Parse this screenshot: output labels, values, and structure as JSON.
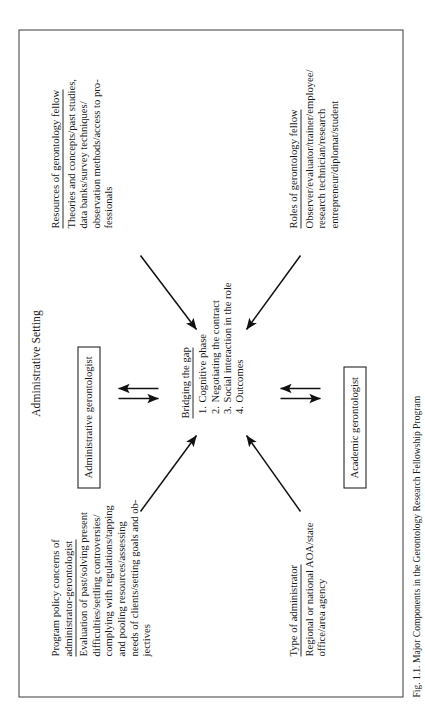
{
  "figure": {
    "title": "Administrative Setting",
    "caption": "Fig. 1.1. Major Components in the Gerontology Research Fellowship Program",
    "frame_color": "#3b3b3b",
    "text_color": "#1a1a1a"
  },
  "blocks": {
    "program_policy": {
      "heading": "Program policy concerns of\nadministrator-gerontologist",
      "body": "Evaluation of past/solving present\ndifficulties/settling controversies/\ncomplying with regulations/tapping\nand pooling resources/assessing\nneeds of clients/setting goals and ob-\njectives"
    },
    "type_of_administrator": {
      "heading": "Type of administrator",
      "body": "Regional or national AOA/state\noffice/area agency"
    },
    "resources": {
      "heading": "Resources of gerontology fellow",
      "body": "Theories and concepts/past studies,\ndata banks/survey techniques/\nobservation methods/access to pro-\nfessionals"
    },
    "roles": {
      "heading": "Roles of gerontology fellow",
      "body": "Observer/evaluator/trainer/employee/\nresearch technician/research\nentrepreneur/diplomat/student"
    },
    "bridging": {
      "heading": "Bridging the gap",
      "items": [
        "Cognitive phase",
        "Negotiating the contract",
        "Social interaction in the role",
        "Outcomes"
      ]
    }
  },
  "nodes": {
    "administrative_gerontologist": "Administrative gerontologist",
    "academic_gerontologist": "Academic gerontologist"
  },
  "arrows": {
    "top_left_diagonal": "arrow-diagonal-down-right",
    "top_right_diagonal": "arrow-diagonal-down-left",
    "bottom_left_diagonal": "arrow-diagonal-up-right",
    "bottom_right_diagonal": "arrow-diagonal-up-left",
    "upper_pair": "bidirectional-arrow-pair",
    "lower_pair": "bidirectional-arrow-pair"
  }
}
